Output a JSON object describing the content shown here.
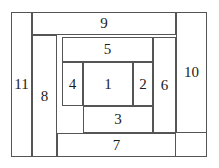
{
  "figure": {
    "line_color": "#555555",
    "text_color": "#1b1b1b",
    "background_color": "#ffffff",
    "outer_frame": {
      "x": 11,
      "y": 12,
      "width": 196,
      "height": 145
    }
  },
  "regions": [
    {
      "id": "1",
      "label": "1",
      "x": 83,
      "y": 62,
      "width": 50,
      "height": 44
    },
    {
      "id": "2",
      "label": "2",
      "x": 133,
      "y": 62,
      "width": 20,
      "height": 44
    },
    {
      "id": "3",
      "label": "3",
      "x": 83,
      "y": 106,
      "width": 70,
      "height": 27
    },
    {
      "id": "4",
      "label": "4",
      "x": 62,
      "y": 62,
      "width": 21,
      "height": 44
    },
    {
      "id": "5",
      "label": "5",
      "x": 62,
      "y": 37,
      "width": 91,
      "height": 25
    },
    {
      "id": "6",
      "label": "6",
      "x": 153,
      "y": 37,
      "width": 23,
      "height": 96
    },
    {
      "id": "7",
      "label": "7",
      "x": 57,
      "y": 133,
      "width": 119,
      "height": 24
    },
    {
      "id": "8",
      "label": "8",
      "x": 32,
      "y": 35,
      "width": 25,
      "height": 122
    },
    {
      "id": "9",
      "label": "9",
      "x": 32,
      "y": 12,
      "width": 144,
      "height": 23
    },
    {
      "id": "10",
      "label": "10",
      "x": 176,
      "y": 12,
      "width": 31,
      "height": 121
    },
    {
      "id": "11",
      "label": "11",
      "x": 11,
      "y": 12,
      "width": 21,
      "height": 145
    }
  ]
}
